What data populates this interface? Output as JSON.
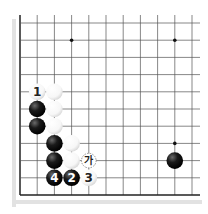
{
  "diagram": {
    "type": "go-board-corner",
    "grid": {
      "origin_x": 20,
      "origin_y": 23,
      "spacing": 17.2,
      "cols": 11,
      "rows": 11,
      "edges": [
        "left",
        "bottom"
      ]
    },
    "colors": {
      "line": "#555555",
      "edge_line": "#222222",
      "shadow": "#e2e2e2",
      "black_stone": "#1a1a1a",
      "white_stone": "#f7f7f7",
      "white_stone_stroke": "#cfcfcf",
      "label_on_black": "#ffffff",
      "label_on_white": "#222222"
    },
    "star_points": [
      {
        "col": 3,
        "row": 1
      },
      {
        "col": 9,
        "row": 1
      },
      {
        "col": 9,
        "row": 7
      }
    ],
    "stones": [
      {
        "color": "white",
        "col": 1,
        "row": 4,
        "label": "1"
      },
      {
        "color": "white",
        "col": 2,
        "row": 4,
        "label": ""
      },
      {
        "color": "black",
        "col": 1,
        "row": 5,
        "label": ""
      },
      {
        "color": "white",
        "col": 2,
        "row": 5,
        "label": ""
      },
      {
        "color": "black",
        "col": 1,
        "row": 6,
        "label": ""
      },
      {
        "color": "white",
        "col": 2,
        "row": 6,
        "label": ""
      },
      {
        "color": "black",
        "col": 2,
        "row": 7,
        "label": ""
      },
      {
        "color": "white",
        "col": 3,
        "row": 7,
        "label": ""
      },
      {
        "color": "black",
        "col": 2,
        "row": 8,
        "label": ""
      },
      {
        "color": "white",
        "col": 3,
        "row": 8,
        "label": ""
      },
      {
        "color": "black",
        "col": 2,
        "row": 9,
        "label": "4"
      },
      {
        "color": "black",
        "col": 3,
        "row": 9,
        "label": "2"
      },
      {
        "color": "white",
        "col": 4,
        "row": 9,
        "label": "3"
      },
      {
        "color": "black",
        "col": 9,
        "row": 8,
        "label": ""
      }
    ],
    "markers": [
      {
        "type": "dashed-circle",
        "col": 4,
        "row": 8,
        "label": "가"
      }
    ]
  }
}
